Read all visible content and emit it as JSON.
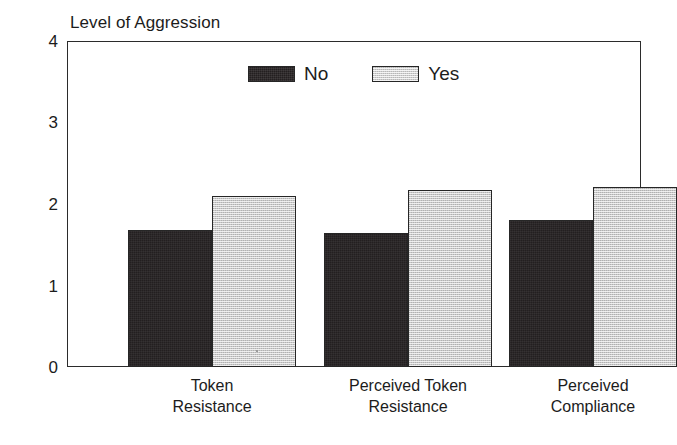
{
  "chart_data": {
    "type": "bar",
    "title": "Level of Aggression",
    "xlabel": "",
    "ylabel": "",
    "ylim": [
      0,
      4
    ],
    "yticks": [
      "0",
      "1",
      "2",
      "3",
      "4"
    ],
    "grid": false,
    "legend_position": "top-inside",
    "categories": [
      "Token Resistance",
      "Perceived Token Resistance",
      "Perceived Compliance"
    ],
    "category_lines": [
      [
        "Token",
        "Resistance"
      ],
      [
        "Perceived Token",
        "Resistance"
      ],
      [
        "Perceived",
        "Compliance"
      ]
    ],
    "series": [
      {
        "name": "No",
        "color": "#231f20",
        "values": [
          1.68,
          1.65,
          1.81
        ]
      },
      {
        "name": "Yes",
        "color": "#cccccc",
        "values": [
          2.1,
          2.17,
          2.21
        ]
      }
    ]
  },
  "legend": {
    "items": [
      {
        "label": "No"
      },
      {
        "label": "Yes"
      }
    ]
  },
  "axis": {
    "y_tick_labels": [
      "4",
      "3",
      "2",
      "1",
      "0"
    ]
  }
}
